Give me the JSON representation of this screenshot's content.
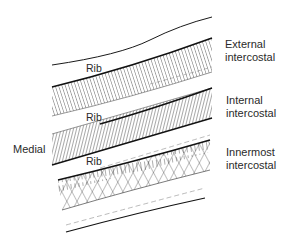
{
  "diagram": {
    "orientation_label": "Medial",
    "rib_labels": [
      "Rib",
      "Rib",
      "Rib"
    ],
    "muscles": [
      {
        "line1": "External",
        "line2": "intercostal",
        "fiber_pattern": "oblique-parallel-down-forward"
      },
      {
        "line1": "Internal",
        "line2": "intercostal",
        "fiber_pattern": "oblique-parallel-opposite"
      },
      {
        "line1": "Innermost",
        "line2": "intercostal",
        "fiber_pattern": "crossed-mesh"
      }
    ],
    "colors": {
      "ink": "#1a1a1a",
      "background": "#ffffff"
    }
  }
}
